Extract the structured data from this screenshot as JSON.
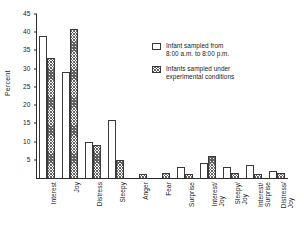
{
  "chart_data": {
    "type": "bar",
    "title": "",
    "xlabel": "",
    "ylabel": "Percent",
    "ylim": [
      0,
      45
    ],
    "yticks": [
      5,
      10,
      15,
      20,
      25,
      30,
      35,
      40,
      45
    ],
    "grid": false,
    "legend_position": "upper-right",
    "categories": [
      "Interest",
      "Joy",
      "Distress",
      "Sleepy",
      "Anger",
      "Fear",
      "Surprise",
      "Interest/\nJoy",
      "Sleepy/\nJoy",
      "Interest/\nSurprise",
      "Distress/\nJoy"
    ],
    "series": [
      {
        "name": "Infant sampled from\n8:00 a.m. to 8:00 p.m.",
        "style": "open",
        "values": [
          39,
          29,
          10,
          16,
          0,
          0,
          3,
          4,
          3,
          3.5,
          2
        ]
      },
      {
        "name": "Infants sampled under\nexperimental conditions",
        "style": "hatched",
        "values": [
          33,
          41,
          9,
          5,
          1,
          1.5,
          1,
          6,
          1.5,
          1,
          1.5
        ]
      }
    ]
  },
  "legend": {
    "entries": [
      {
        "swatch": "open",
        "label": "Infant sampled from\n8:00 a.m. to 8:00 p.m."
      },
      {
        "swatch": "hatched",
        "label": "Infants sampled under\nexperimental conditions"
      }
    ]
  }
}
